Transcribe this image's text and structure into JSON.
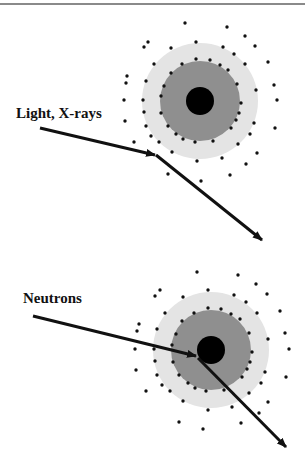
{
  "figure": {
    "colors": {
      "outer_shell": "#e4e4e4",
      "inner_shell": "#8f8f8f",
      "nucleus": "#000000",
      "electron": "#111111",
      "arrow": "#111111",
      "top_rule": "#8a8a8a"
    },
    "panels": [
      {
        "id": "light-xrays",
        "label": "Light, X-rays",
        "interaction": "scatters off electron cloud",
        "atom": {
          "cx": 200,
          "cy": 101,
          "r_outer": 58,
          "r_inner": 40,
          "r_nucleus": 14
        },
        "incoming": {
          "x1": 40,
          "y1": 128,
          "x2": 155,
          "y2": 155
        },
        "outgoing": {
          "x1": 157,
          "y1": 156,
          "x2": 262,
          "y2": 240
        }
      },
      {
        "id": "neutrons",
        "label": "Neutrons",
        "interaction": "scatters off nucleus",
        "atom": {
          "cx": 211,
          "cy": 350,
          "r_outer": 58,
          "r_inner": 40,
          "r_nucleus": 14
        },
        "incoming": {
          "x1": 33,
          "y1": 316,
          "x2": 196,
          "y2": 356
        },
        "outgoing": {
          "x1": 198,
          "y1": 358,
          "x2": 286,
          "y2": 447
        }
      }
    ]
  }
}
